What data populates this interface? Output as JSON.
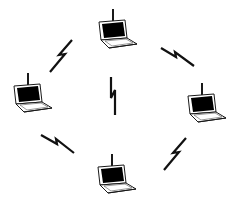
{
  "diagram": {
    "type": "wireless-ad-hoc-network",
    "colors": {
      "background": "#ffffff",
      "outline": "#1a1a1a",
      "screen": "#000000",
      "body_fill": "#ffffff",
      "bolt": "#111111"
    },
    "nodes": [
      {
        "id": "laptop-top",
        "icon": "laptop-with-antenna-icon",
        "x": 93,
        "y": 8
      },
      {
        "id": "laptop-left",
        "icon": "laptop-with-antenna-icon",
        "x": 8,
        "y": 72
      },
      {
        "id": "laptop-right",
        "icon": "laptop-with-antenna-icon",
        "x": 182,
        "y": 82
      },
      {
        "id": "laptop-bottom",
        "icon": "laptop-with-antenna-icon",
        "x": 92,
        "y": 153
      }
    ],
    "links": [
      {
        "id": "bolt-upper-left",
        "icon": "lightning-bolt-icon",
        "x": 48,
        "y": 40,
        "rotate": 40
      },
      {
        "id": "bolt-upper-right",
        "icon": "lightning-bolt-icon",
        "x": 160,
        "y": 45,
        "rotate": -60
      },
      {
        "id": "bolt-center",
        "icon": "lightning-bolt-icon",
        "x": 103,
        "y": 75,
        "rotate": 0
      },
      {
        "id": "bolt-lower-left",
        "icon": "lightning-bolt-icon",
        "x": 42,
        "y": 130,
        "rotate": -58
      },
      {
        "id": "bolt-lower-right",
        "icon": "lightning-bolt-icon",
        "x": 160,
        "y": 136,
        "rotate": 40
      }
    ]
  }
}
